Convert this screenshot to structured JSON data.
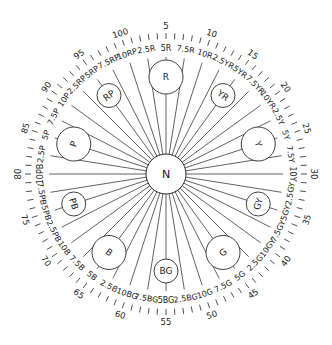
{
  "diagram": {
    "center": {
      "x": 166,
      "y": 174
    },
    "center_label": "N",
    "number_ticks": {
      "count": 100,
      "labels": [
        "5",
        "10",
        "15",
        "20",
        "25",
        "30",
        "35",
        "40",
        "45",
        "50",
        "55",
        "60",
        "65",
        "70",
        "75",
        "80",
        "85",
        "90",
        "95",
        "100"
      ],
      "label_values": [
        5,
        10,
        15,
        20,
        25,
        30,
        35,
        40,
        45,
        50,
        55,
        60,
        65,
        70,
        75,
        80,
        85,
        90,
        95,
        100
      ]
    },
    "hue_rays": [
      {
        "label": "2.5R",
        "value": 2.5
      },
      {
        "label": "5R",
        "value": 5
      },
      {
        "label": "7.5R",
        "value": 7.5
      },
      {
        "label": "10R",
        "value": 10
      },
      {
        "label": "2.5YR",
        "value": 12.5
      },
      {
        "label": "5YR",
        "value": 15
      },
      {
        "label": "7.5YR",
        "value": 17.5
      },
      {
        "label": "10YR",
        "value": 20
      },
      {
        "label": "2.5Y",
        "value": 22.5
      },
      {
        "label": "5Y",
        "value": 25
      },
      {
        "label": "7.5Y",
        "value": 27.5
      },
      {
        "label": "10Y",
        "value": 30
      },
      {
        "label": "2.5GY",
        "value": 32.5
      },
      {
        "label": "5GY",
        "value": 35
      },
      {
        "label": "7.5GY",
        "value": 37.5
      },
      {
        "label": "10GY",
        "value": 40
      },
      {
        "label": "2.5G",
        "value": 42.5
      },
      {
        "label": "5G",
        "value": 45
      },
      {
        "label": "7.5G",
        "value": 47.5
      },
      {
        "label": "10G",
        "value": 50
      },
      {
        "label": "2.5BG",
        "value": 52.5
      },
      {
        "label": "5BG",
        "value": 55
      },
      {
        "label": "7.5BG",
        "value": 57.5
      },
      {
        "label": "10BG",
        "value": 60
      },
      {
        "label": "2.5B",
        "value": 62.5
      },
      {
        "label": "5B",
        "value": 65
      },
      {
        "label": "7.5B",
        "value": 67.5
      },
      {
        "label": "10B",
        "value": 70
      },
      {
        "label": "2.5PB",
        "value": 72.5
      },
      {
        "label": "5PB",
        "value": 75
      },
      {
        "label": "7.5PB",
        "value": 77.5
      },
      {
        "label": "10PB",
        "value": 80
      },
      {
        "label": "2.5P",
        "value": 82.5
      },
      {
        "label": "5P",
        "value": 85
      },
      {
        "label": "7.5P",
        "value": 87.5
      },
      {
        "label": "10P",
        "value": 90
      },
      {
        "label": "2.5RP",
        "value": 92.5
      },
      {
        "label": "5RP",
        "value": 95
      },
      {
        "label": "7.5RP",
        "value": 97.5
      },
      {
        "label": "10RP",
        "value": 100
      }
    ],
    "hue_circles": [
      {
        "label": "R",
        "value": 5,
        "major": true
      },
      {
        "label": "YR",
        "value": 15,
        "major": false
      },
      {
        "label": "Y",
        "value": 25,
        "major": true
      },
      {
        "label": "GY",
        "value": 35,
        "major": false
      },
      {
        "label": "G",
        "value": 45,
        "major": true
      },
      {
        "label": "BG",
        "value": 55,
        "major": false
      },
      {
        "label": "B",
        "value": 65,
        "major": true
      },
      {
        "label": "PB",
        "value": 75,
        "major": false
      },
      {
        "label": "P",
        "value": 85,
        "major": true
      },
      {
        "label": "RP",
        "value": 95,
        "major": false
      }
    ],
    "colors": {
      "line": "#3a3a3a",
      "text": "#1a1a1a",
      "background": "#ffffff"
    }
  }
}
